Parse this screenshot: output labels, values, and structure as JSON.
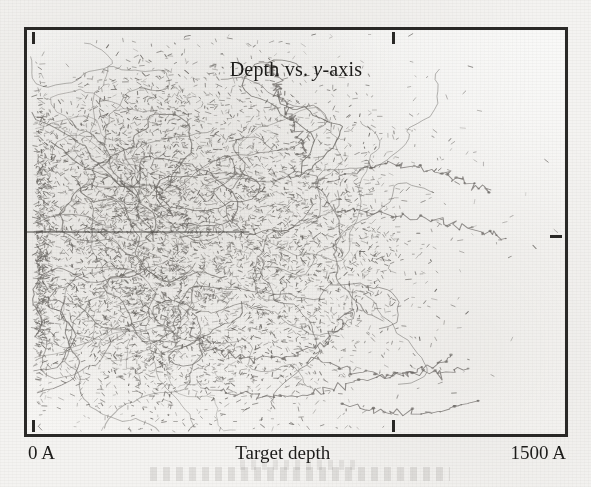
{
  "figure": {
    "title_prefix": "Depth vs. ",
    "title_italic": "y",
    "title_suffix": "-axis",
    "title_full": "Depth vs. y-axis"
  },
  "axes": {
    "x_label": "Target depth",
    "x_min_label": "0 A",
    "x_max_label": "1500 A",
    "frame_color": "#2a2927",
    "background_color": "#f7f7f6",
    "ticks": [
      {
        "name": "tick-top-left",
        "side": "top",
        "position_fraction": 0.0
      },
      {
        "name": "tick-top-center",
        "side": "top",
        "position_fraction": 0.68
      },
      {
        "name": "tick-bottom-left",
        "side": "bottom",
        "position_fraction": 0.0
      },
      {
        "name": "tick-bottom-center",
        "side": "bottom",
        "position_fraction": 0.68
      },
      {
        "name": "tick-right-mid",
        "side": "right",
        "position_fraction": 0.51
      }
    ]
  },
  "chart_data": {
    "type": "scatter",
    "title": "Depth vs. y-axis",
    "xlabel": "Target depth",
    "ylabel": "y-axis",
    "xlim": [
      0,
      1500
    ],
    "xunits": "A",
    "ylim": [
      -750,
      750
    ],
    "yunits": "A",
    "grid": false,
    "legend": null,
    "point_color": "#6d6a66",
    "beam_axis": {
      "y_value": 0,
      "x_start": 0,
      "x_end": 620,
      "color": "#3a3835",
      "description": "dark horizontal incident-beam line along y = 0"
    },
    "cloud": {
      "x_center_fraction": 0.3,
      "y_center_fraction": 0.52,
      "x_extent_fraction": 0.62,
      "y_extent_fraction": 0.7,
      "n_points": 9000,
      "peak_depth": 430,
      "straggle_depth": 300,
      "lateral_straggle": 290
    },
    "outlier_tracks": [
      {
        "name": "upper-spike",
        "points": [
          [
            520,
            318
          ],
          [
            512,
            286
          ],
          [
            500,
            258
          ],
          [
            496,
            232
          ],
          [
            484,
            210
          ],
          [
            478,
            186
          ],
          [
            470,
            162
          ],
          [
            466,
            140
          ],
          [
            462,
            122
          ],
          [
            458,
            108
          ],
          [
            452,
            96
          ],
          [
            448,
            84
          ]
        ]
      },
      {
        "name": "right-branch-upper",
        "points": [
          [
            560,
            372
          ],
          [
            600,
            352
          ],
          [
            640,
            340
          ],
          [
            680,
            332
          ],
          [
            720,
            340
          ],
          [
            760,
            352
          ],
          [
            800,
            368
          ],
          [
            836,
            384
          ],
          [
            862,
            396
          ]
        ]
      },
      {
        "name": "right-branch-mid",
        "points": [
          [
            580,
            444
          ],
          [
            640,
            452
          ],
          [
            700,
            462
          ],
          [
            760,
            474
          ],
          [
            810,
            486
          ],
          [
            856,
            500
          ],
          [
            890,
            516
          ]
        ]
      },
      {
        "name": "lower-loop",
        "points": [
          [
            300,
            740
          ],
          [
            330,
            782
          ],
          [
            372,
            808
          ],
          [
            424,
            820
          ],
          [
            480,
            812
          ],
          [
            528,
            790
          ],
          [
            566,
            760
          ],
          [
            590,
            724
          ],
          [
            600,
            690
          ]
        ]
      },
      {
        "name": "lower-right-tail",
        "points": [
          [
            520,
            810
          ],
          [
            572,
            832
          ],
          [
            624,
            848
          ],
          [
            676,
            854
          ],
          [
            720,
            846
          ],
          [
            758,
            828
          ],
          [
            788,
            804
          ]
        ]
      },
      {
        "name": "bottom-long-tail",
        "points": [
          [
            330,
            880
          ],
          [
            380,
            898
          ],
          [
            440,
            908
          ],
          [
            500,
            906
          ],
          [
            560,
            892
          ],
          [
            612,
            872
          ],
          [
            664,
            858
          ],
          [
            716,
            850
          ],
          [
            768,
            846
          ],
          [
            820,
            838
          ]
        ]
      },
      {
        "name": "bottom-low-arc",
        "points": [
          [
            596,
            930
          ],
          [
            648,
            944
          ],
          [
            700,
            950
          ],
          [
            752,
            946
          ],
          [
            800,
            934
          ],
          [
            840,
            918
          ]
        ]
      }
    ]
  }
}
